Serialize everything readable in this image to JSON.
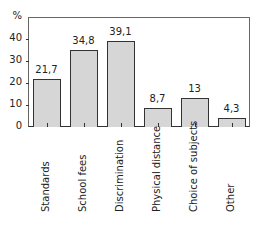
{
  "chart_data": {
    "type": "bar",
    "title": "",
    "xlabel": "",
    "ylabel": "%",
    "categories": [
      "Standards",
      "School fees",
      "Discrimination",
      "Physical distance",
      "Choice of subjects",
      "Other"
    ],
    "values": [
      21.7,
      34.8,
      39.1,
      8.7,
      13,
      4.3
    ],
    "value_labels": [
      "21,7",
      "34,8",
      "39,1",
      "8,7",
      "13",
      "4,3"
    ],
    "yticks": [
      "0",
      "10",
      "20",
      "30",
      "40"
    ],
    "ylim": [
      0,
      50
    ],
    "grid": false,
    "legend": null,
    "bar_color": "#d6d6d6",
    "edge_color": "#333333"
  }
}
